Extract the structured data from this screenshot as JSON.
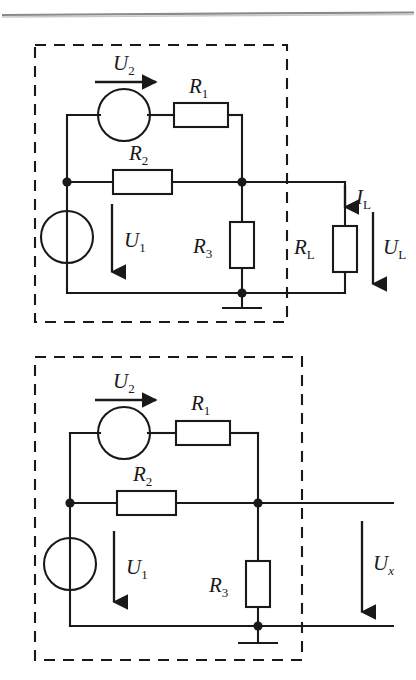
{
  "page": {
    "kind": "circuit-diagram-figure",
    "background": "#ffffff",
    "ink": "#191919",
    "rule_color": "#8a8a8a"
  },
  "figures": [
    {
      "id": "top-circuit",
      "caption": "",
      "dashed_box": true,
      "labels": {
        "u2": "U",
        "u2_sub": "2",
        "r1": "R",
        "r1_sub": "1",
        "r2": "R",
        "r2_sub": "2",
        "r3": "R",
        "r3_sub": "3",
        "u1": "U",
        "u1_sub": "1",
        "il": "I",
        "il_sub": "L",
        "rl": "R",
        "rl_sub": "L",
        "ul": "U",
        "ul_sub": "L"
      },
      "components": [
        "voltage-source-u2",
        "resistor-r1",
        "resistor-r2",
        "resistor-r3",
        "voltage-source-u1",
        "resistor-rl",
        "ground"
      ]
    },
    {
      "id": "bottom-circuit",
      "caption": "",
      "dashed_box": true,
      "labels": {
        "u2": "U",
        "u2_sub": "2",
        "r1": "R",
        "r1_sub": "1",
        "r2": "R",
        "r2_sub": "2",
        "r3": "R",
        "r3_sub": "3",
        "u1": "U",
        "u1_sub": "1",
        "ux": "U",
        "ux_sub": "x"
      },
      "components": [
        "voltage-source-u2",
        "resistor-r1",
        "resistor-r2",
        "resistor-r3",
        "voltage-source-u1",
        "ground",
        "open-terminals"
      ]
    }
  ]
}
